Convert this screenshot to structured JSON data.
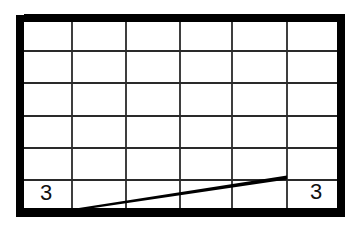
{
  "diagram": {
    "type": "grid-with-line",
    "grid": {
      "columns": 6,
      "rows": 6,
      "column_edges_x": [
        24,
        72,
        126,
        180,
        232,
        287,
        337
      ],
      "row_edges_y": [
        22,
        51,
        83,
        116,
        148,
        180,
        208
      ],
      "line_color": "#2a2a2a"
    },
    "border": {
      "color": "#000000",
      "thickness": 8,
      "left_bar": {
        "x": 16,
        "y": 15,
        "w": 8,
        "h": 202
      },
      "top_bar": {
        "x": 24,
        "y": 14,
        "w": 321,
        "h": 8
      },
      "right_bar": {
        "x": 337,
        "y": 22,
        "w": 8,
        "h": 195
      },
      "bottom_bar": {
        "x": 24,
        "y": 208,
        "w": 313,
        "h": 9
      }
    },
    "segment": {
      "x1": 70,
      "y1": 210,
      "x2": 287,
      "y2": 177,
      "color": "#000000",
      "thickness": 4
    },
    "labels": [
      {
        "text": "3",
        "position": "bottom-left-cell"
      },
      {
        "text": "3",
        "position": "bottom-right-cell"
      }
    ]
  }
}
